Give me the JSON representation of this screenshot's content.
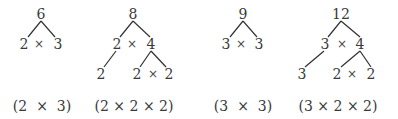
{
  "diagram": {
    "type": "factor-trees",
    "trees": [
      {
        "root": "6",
        "level1": {
          "left": "2",
          "op": "×",
          "right": "3"
        },
        "expression": "(2  ×  3)"
      },
      {
        "root": "8",
        "level1": {
          "left": "2",
          "op": "×",
          "right": "4"
        },
        "level2": {
          "from_left": "2",
          "left": "2",
          "op": "×",
          "right": "2"
        },
        "expression": "(2 × 2 × 2)"
      },
      {
        "root": "9",
        "level1": {
          "left": "3",
          "op": "×",
          "right": "3"
        },
        "expression": "(3  ×  3)"
      },
      {
        "root": "12",
        "level1": {
          "left": "3",
          "op": "×",
          "right": "4"
        },
        "level2": {
          "from_left": "3",
          "left": "2",
          "op": "×",
          "right": "2"
        },
        "expression": "(3 × 2 × 2)"
      }
    ],
    "colors": {
      "text": "#3a3a3a",
      "line": "#333333",
      "background": "#ffffff"
    }
  }
}
